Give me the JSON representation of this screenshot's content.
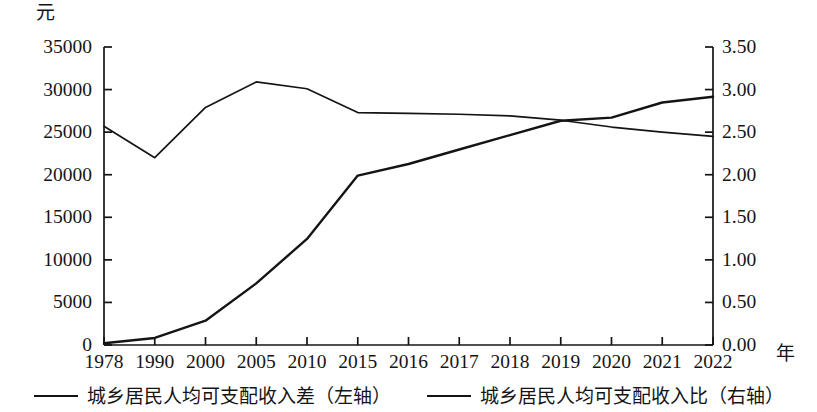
{
  "chart_data": {
    "type": "line",
    "title": "",
    "xlabel": "年",
    "ylabel": "元",
    "y2label": "",
    "grid": false,
    "legend_position": "bottom",
    "categories": [
      "1978",
      "1990",
      "2000",
      "2005",
      "2010",
      "2015",
      "2016",
      "2017",
      "2018",
      "2019",
      "2020",
      "2021",
      "2022"
    ],
    "ylim": [
      0,
      35000
    ],
    "y2lim": [
      0.0,
      3.5
    ],
    "y_ticks": [
      "0",
      "5000",
      "10000",
      "15000",
      "20000",
      "25000",
      "30000",
      "35000"
    ],
    "y2_ticks": [
      "0.00",
      "0.50",
      "1.00",
      "1.50",
      "2.00",
      "2.50",
      "3.00",
      "3.50"
    ],
    "series": [
      {
        "name": "城乡居民人均可支配收入差（左轴）",
        "axis": "left",
        "unit": "元",
        "values": [
          209,
          824,
          2856,
          7238,
          12461,
          19898,
          21258,
          22964,
          24657,
          26338,
          26703,
          28481,
          29150
        ]
      },
      {
        "name": "城乡居民人均可支配收入比（右轴）",
        "axis": "right",
        "unit": "",
        "values": [
          2.57,
          2.2,
          2.79,
          3.09,
          3.01,
          2.73,
          2.72,
          2.71,
          2.69,
          2.64,
          2.56,
          2.5,
          2.45
        ]
      }
    ]
  },
  "axes": {
    "left_unit": "元",
    "x_unit": "年"
  },
  "legend": {
    "entries": [
      {
        "label": "城乡居民人均可支配收入差（左轴）",
        "swatch": "line-swatch"
      },
      {
        "label": "城乡居民人均可支配收入比（右轴）",
        "swatch": "line-swatch"
      }
    ]
  }
}
